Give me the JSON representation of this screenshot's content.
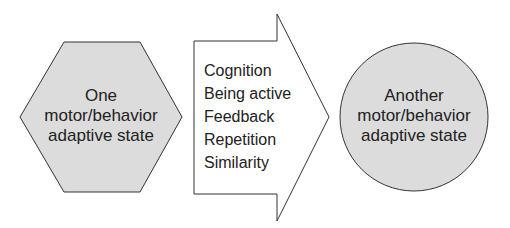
{
  "diagram": {
    "start_state": {
      "shape": "hexagon",
      "lines": [
        "One",
        "motor/behavior",
        "adaptive state"
      ]
    },
    "transition": {
      "shape": "arrow",
      "factors": [
        "Cognition",
        "Being active",
        "Feedback",
        "Repetition",
        "Similarity"
      ]
    },
    "end_state": {
      "shape": "circle",
      "lines": [
        "Another",
        "motor/behavior",
        "adaptive state"
      ]
    },
    "colors": {
      "state_fill": "#dcdcdc",
      "arrow_fill": "#ffffff",
      "stroke": "#333333",
      "text": "#222222"
    }
  }
}
